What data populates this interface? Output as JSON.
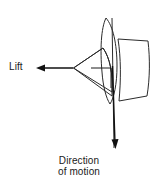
{
  "figure": {
    "type": "technical-diagram",
    "background_color": "#ffffff",
    "stroke_color": "#1a1a1a"
  },
  "labels": {
    "lift": "Lift",
    "direction_line1": "Direction",
    "direction_line2": "of motion"
  },
  "annotations": {
    "lift_arrow": {
      "name": "lift-force-arrow",
      "direction": "left",
      "from_x": 73,
      "from_y": 68,
      "to_x": 36,
      "to_y": 68
    },
    "motion_arrow": {
      "name": "direction-of-motion-arrow",
      "direction": "down",
      "from_x": 113,
      "from_y": 66,
      "to_x": 115,
      "to_y": 149
    },
    "right_angle_marker": {
      "name": "right-angle-marker",
      "corner_x": 111,
      "corner_y": 68,
      "size": 20
    }
  },
  "shapes": {
    "blade_sector": "fan-shaped rotor blade sweeping left-down from hub",
    "airfoil_ellipse": "narrow vertical airfoil cross-section",
    "wing_quad": "quadrilateral wing panel at right",
    "hub_line": "vertical rotor shaft line"
  }
}
